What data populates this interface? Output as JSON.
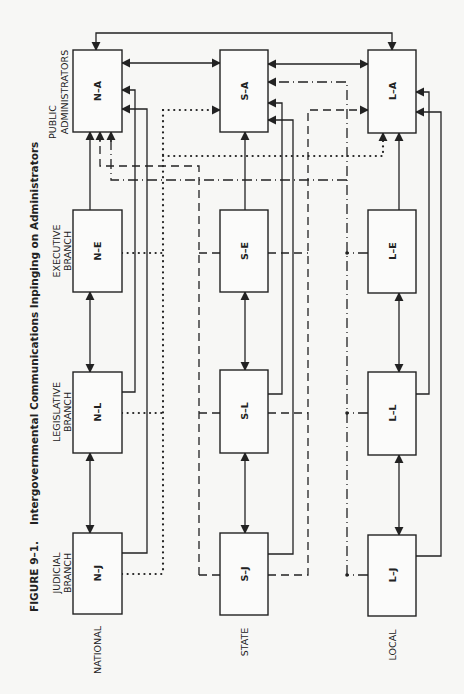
{
  "figure": {
    "number": "FIGURE 9–1.",
    "title": "Intergovernmental Communications Inpinging on Administrators"
  },
  "columns": [
    {
      "key": "N",
      "label": "NATIONAL"
    },
    {
      "key": "S",
      "label": "STATE"
    },
    {
      "key": "L",
      "label": "LOCAL"
    }
  ],
  "rows": {
    "admin": {
      "line1": "PUBLIC",
      "line2": "ADMINISTRATORS"
    },
    "exec": {
      "line1": "EXECUTIVE",
      "line2": "BRANCH"
    },
    "leg": {
      "line1": "LEGISLATIVE",
      "line2": "BRANCH"
    },
    "jud": {
      "line1": "JUDICIAL",
      "line2": "BRANCH"
    }
  },
  "boxes": {
    "NA": "N–A",
    "NE": "N–E",
    "NL": "N–L",
    "NJ": "N–J",
    "SA": "S–A",
    "SE": "S–E",
    "SL": "S–L",
    "SJ": "S–J",
    "LA": "L–A",
    "LE": "L–E",
    "LL": "L–L",
    "LJ": "L–J"
  },
  "line_styles": {
    "solid": "intra-level communication",
    "dotted": "national branches to state/local administrators",
    "dashed": "state branches to national/local administrators",
    "dash-dot": "local branches to national/state administrators"
  },
  "colors": {
    "ink": "#222222",
    "paper": "#f7f7f5"
  }
}
